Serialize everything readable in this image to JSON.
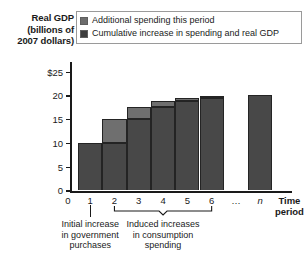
{
  "axis_title": {
    "line1": "Real GDP",
    "line2": "(billions of",
    "line3": "2007 dollars)"
  },
  "legend": {
    "items": [
      {
        "label": "Additional spending this period",
        "swatch": "light",
        "color": "#6d6d6d"
      },
      {
        "label": "Cumulative increase in spending and real GDP",
        "swatch": "dark",
        "color": "#3d3d3d"
      }
    ]
  },
  "annotations": {
    "initial": {
      "line1": "Initial increase",
      "line2": "in government",
      "line3": "purchases"
    },
    "induced": {
      "line1": "Induced increases",
      "line2": "in consumption",
      "line3": "spending"
    }
  },
  "chart_data": {
    "type": "bar",
    "title": "",
    "subtitle": "",
    "ylabel": "Real GDP (billions of 2007 dollars)",
    "xlabel": "Time period",
    "ylim": [
      0,
      27
    ],
    "yticks": [
      0,
      5,
      10,
      15,
      20,
      25
    ],
    "ytick_labels": [
      "0",
      "5",
      "10",
      "15",
      "20",
      "$25"
    ],
    "grid": false,
    "legend_position": "top",
    "categories": [
      "1",
      "2",
      "3",
      "4",
      "5",
      "6",
      "…",
      "n"
    ],
    "stacked": true,
    "series": [
      {
        "name": "Cumulative increase in spending and real GDP",
        "color": "#484848",
        "values": [
          10,
          10,
          15,
          17.5,
          18.75,
          19.4,
          null,
          20
        ]
      },
      {
        "name": "Additional spending this period",
        "color": "#6f6f6f",
        "values": [
          0,
          5,
          2.5,
          1.25,
          0.65,
          0.3,
          null,
          0
        ]
      }
    ],
    "bar_totals": [
      10,
      15,
      17.5,
      18.75,
      19.4,
      19.7,
      null,
      20
    ],
    "annotations": [
      {
        "text": "Initial increase in government purchases",
        "spans": [
          "1"
        ]
      },
      {
        "text": "Induced increases in consumption spending",
        "spans": [
          "2",
          "6"
        ]
      }
    ]
  }
}
